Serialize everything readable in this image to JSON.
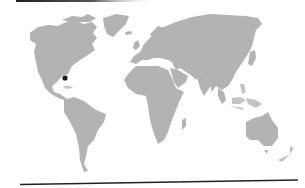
{
  "map": {
    "type": "world-map",
    "projection": "equirectangular-like",
    "land_color": "#b3b3b3",
    "ocean_color": "#ffffff",
    "continents": [
      "North America",
      "Greenland",
      "South America",
      "Europe",
      "Asia",
      "Africa",
      "Madagascar",
      "Australia",
      "New Zealand",
      "Japan",
      "Indonesia",
      "UK",
      "Iceland"
    ],
    "marker": {
      "shape": "dot",
      "color": "#1a1a1a",
      "approx_location": "off southeastern United States (Atlantic, near Florida)",
      "x": 65,
      "y": 78
    },
    "frame": {
      "top_rule_color": "#222222",
      "bottom_rule_color": "#222222"
    }
  }
}
